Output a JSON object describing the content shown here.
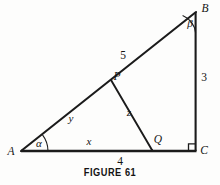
{
  "figure": {
    "caption": "FIGURE 61",
    "line_color": "#1b1b1b",
    "background_color": "#fdfdfc",
    "vertices": {
      "A": "A",
      "B": "B",
      "C": "C",
      "P": "P",
      "Q": "Q"
    },
    "angles": {
      "alpha": "α",
      "beta": "β"
    },
    "segment_labels": {
      "AP": "y",
      "AQ": "x",
      "PQ": "z",
      "PB": "5",
      "BC": "3",
      "AC": "4"
    },
    "right_angle_at": "C"
  }
}
